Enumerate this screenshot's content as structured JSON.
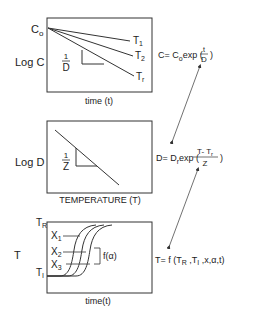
{
  "panels": [
    {
      "id": "concentration",
      "y_label": "Log C",
      "x_label": "time (t)",
      "y_start_label_main": "C",
      "y_start_label_sub": "o",
      "slope_label_num": "1",
      "slope_label_den": "D",
      "series": [
        {
          "name": "T",
          "sub": "1"
        },
        {
          "name": "T",
          "sub": "2"
        },
        {
          "name": "T",
          "sub": "r"
        }
      ],
      "equation": {
        "lhs": "C= C",
        "lhs_sub": "o",
        "func": "exp (",
        "num": "t",
        "den": "D",
        "close": ")"
      }
    },
    {
      "id": "d-value",
      "y_label": "Log D",
      "x_label": "TEMPERATURE (T)",
      "slope_label_num": "1",
      "slope_label_den": "Z",
      "equation": {
        "lhs": "D= D",
        "lhs_sub": "r",
        "func": "exp (",
        "num_a": "T- T",
        "num_sub": "r",
        "den": "Z",
        "close": ")"
      }
    },
    {
      "id": "temperature",
      "y_label": "T",
      "x_label": "time(t)",
      "top_label": "T",
      "top_sub": "R",
      "bottom_label": "T",
      "bottom_sub": "I",
      "positions": [
        {
          "name": "X",
          "sub": "1"
        },
        {
          "name": "X",
          "sub": "2"
        },
        {
          "name": "X",
          "sub": "3"
        }
      ],
      "curve_label": "f(α)",
      "equation": {
        "lhs": "T= f (T",
        "sub1": "R",
        "mid": " ,T",
        "sub2": "I",
        "tail": "  ,x,α,t)"
      }
    }
  ]
}
